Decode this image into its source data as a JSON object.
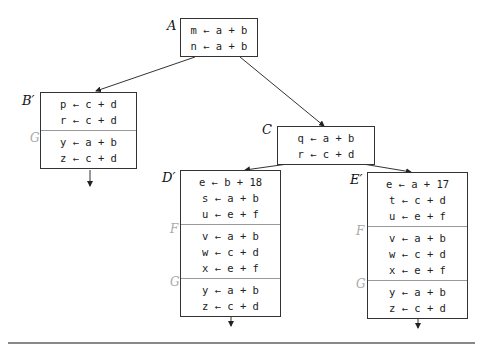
{
  "diagram": {
    "blocks": {
      "A": {
        "label": "A",
        "sections": [
          {
            "name": "",
            "lines": [
              "m ← a + b",
              "n ← a + b"
            ]
          }
        ]
      },
      "B": {
        "label": "B′",
        "sections": [
          {
            "name": "",
            "lines": [
              "p ← c + d",
              "r ← c + d"
            ]
          },
          {
            "name": "G",
            "lines": [
              "y ← a + b",
              "z ← c + d"
            ]
          }
        ]
      },
      "C": {
        "label": "C",
        "sections": [
          {
            "name": "",
            "lines": [
              "q ← a + b",
              "r ← c + d"
            ]
          }
        ]
      },
      "D": {
        "label": "D′",
        "sections": [
          {
            "name": "",
            "lines": [
              "e ← b + 18",
              "s ← a + b",
              "u ← e + f"
            ]
          },
          {
            "name": "F",
            "lines": [
              "v ← a + b",
              "w ← c + d",
              "x ← e + f"
            ]
          },
          {
            "name": "G",
            "lines": [
              "y ← a + b",
              "z ← c + d"
            ]
          }
        ]
      },
      "E": {
        "label": "E′",
        "sections": [
          {
            "name": "",
            "lines": [
              "e ← a + 17",
              "t ← c + d",
              "u ← e + f"
            ]
          },
          {
            "name": "F",
            "lines": [
              "v ← a + b",
              "w ← c + d",
              "x ← e + f"
            ]
          },
          {
            "name": "G",
            "lines": [
              "y ← a + b",
              "z ← c + d"
            ]
          }
        ]
      }
    },
    "edges": [
      [
        "A",
        "B′"
      ],
      [
        "A",
        "C"
      ],
      [
        "C",
        "D′"
      ],
      [
        "C",
        "E′"
      ],
      [
        "B′",
        "exit"
      ],
      [
        "D′",
        "exit"
      ],
      [
        "E′",
        "exit"
      ]
    ]
  }
}
